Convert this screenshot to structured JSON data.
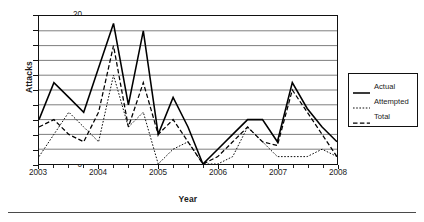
{
  "axes": {
    "y_title": "Attacks",
    "x_title": "Year",
    "y_ticks": [
      0,
      2,
      4,
      6,
      8,
      10,
      12,
      14,
      16,
      18,
      20
    ],
    "x_ticks": [
      "2003",
      "2004",
      "2005",
      "2006",
      "2007",
      "2008"
    ]
  },
  "legend": {
    "items": [
      {
        "label": "Actual",
        "style": "solid"
      },
      {
        "label": "Attempted",
        "style": "dotted"
      },
      {
        "label": "Total",
        "style": "dashed"
      }
    ]
  },
  "chart_data": {
    "type": "line",
    "title": "",
    "xlabel": "Year",
    "ylabel": "Attacks",
    "ylim": [
      0,
      20
    ],
    "xlim": [
      2003,
      2008
    ],
    "grid": "horizontal",
    "legend_position": "right-outside",
    "x_tick_labels": [
      "2003",
      "2004",
      "2005",
      "2006",
      "2007",
      "2008"
    ],
    "x_minor_ticks_per_interval": 4,
    "x": [
      2003.0,
      2003.25,
      2003.5,
      2003.75,
      2004.0,
      2004.25,
      2004.5,
      2004.75,
      2005.0,
      2005.25,
      2005.5,
      2005.75,
      2006.0,
      2006.25,
      2006.5,
      2006.75,
      2007.0,
      2007.25,
      2007.5,
      2007.75,
      2008.0
    ],
    "series": [
      {
        "name": "Actual",
        "style": "solid",
        "values": [
          6,
          11,
          9,
          7,
          13,
          19,
          8,
          18,
          4,
          9,
          5,
          0,
          2,
          4,
          6,
          6,
          3,
          11,
          7.5,
          5,
          3
        ]
      },
      {
        "name": "Attempted",
        "style": "dotted",
        "values": [
          1,
          4,
          7,
          5,
          3,
          12,
          5,
          7,
          0,
          2,
          3,
          0,
          0,
          1,
          5,
          3,
          1,
          1,
          1,
          2,
          1
        ]
      },
      {
        "name": "Total",
        "style": "dashed",
        "values": [
          5,
          6,
          4,
          3,
          7,
          16,
          5,
          11,
          4,
          6,
          3,
          0,
          1,
          3,
          5,
          3,
          2.5,
          10,
          7,
          4,
          1
        ]
      }
    ]
  }
}
